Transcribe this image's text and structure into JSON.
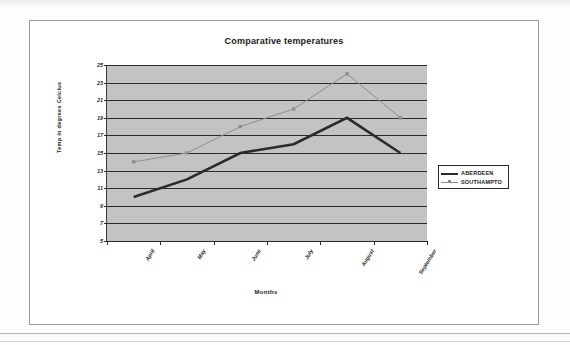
{
  "chart_data": {
    "type": "line",
    "title": "Comparative temperatures",
    "xlabel": "Months",
    "ylabel": "Temp in degrees Celcius",
    "categories": [
      "April",
      "May",
      "June",
      "July",
      "August",
      "September"
    ],
    "series": [
      {
        "name": "ABERDEEN",
        "values": [
          10,
          12,
          15,
          16,
          19,
          15
        ],
        "color": "#2b2b2b",
        "line_width": 2.6,
        "marker": "none"
      },
      {
        "name": "SOUTHAMPTON",
        "values": [
          14,
          15,
          18,
          20,
          24,
          19
        ],
        "color": "#8e8e8e",
        "line_width": 1,
        "marker": "square"
      }
    ],
    "yticks": [
      25,
      23,
      21,
      19,
      17,
      15,
      13,
      11,
      9,
      7,
      5
    ],
    "ylim": [
      5,
      25
    ],
    "grid": true,
    "grid_axis": "y",
    "legend_position": "right",
    "plot_background": "#c3c3c3"
  },
  "legend": {
    "entries": [
      {
        "label": "ABERDEEN"
      },
      {
        "label": "SOUTHAMPTO"
      }
    ]
  }
}
